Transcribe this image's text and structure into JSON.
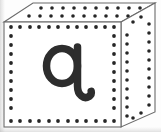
{
  "image": {
    "title": "Alphabet block cube showing the letter q",
    "subject": "toy-block-cube",
    "width": 161,
    "height": 132,
    "background_color": "#fdfdfd"
  },
  "block": {
    "shape": "cube",
    "projection": "oblique-3d",
    "letter": "q",
    "letter_case": "lowercase",
    "letter_style": "handwriting-tailed",
    "letter_color": "#2d2d2d",
    "outline_color": "#6b6b6b",
    "face_color": "#ffffff",
    "dot_color": "#262626",
    "faces": [
      {
        "name": "front-face",
        "label": "Front face with letter",
        "decoration": "dotted-border",
        "dots_top_row": 12,
        "dots_side_column": 11
      },
      {
        "name": "top-face",
        "label": "Top face",
        "decoration": "dotted-grid",
        "dot_rows": 2,
        "dots_per_row": 12
      },
      {
        "name": "right-face",
        "label": "Right side face",
        "decoration": "dotted-border",
        "dots_side_column": 11,
        "dots_top_row": 3
      }
    ]
  },
  "geometry": {
    "front_face": {
      "x": 4,
      "y": 22,
      "width": 117,
      "height": 105
    },
    "top_face_points": "4,22 33,3 155,3 121,22",
    "right_face_points": "121,22 155,3 155,112 121,127"
  },
  "dots": {
    "radius": 1.9,
    "front_top_y": 27,
    "front_bottom_y": 121,
    "front_left_x": 11,
    "front_right_x": 114,
    "front_cols": 12,
    "front_rows": 11
  },
  "glyph": {
    "character": "q",
    "stroke_width": 7.5,
    "bowl_center_x": 62,
    "bowl_center_y": 66,
    "bowl_radius_x": 16,
    "bowl_radius_y": 18,
    "stem_x": 78,
    "stem_top_y": 48,
    "tail_end_x": 91,
    "tail_end_y": 98
  },
  "alt_text": "A white cubic alphabet block drawn in oblique 3-D projection. The front face is bordered by a ring of small black dots and displays a large lowercase letter q with a curled tail. The top face carries two rows of dots and the right side face carries a dotted border."
}
